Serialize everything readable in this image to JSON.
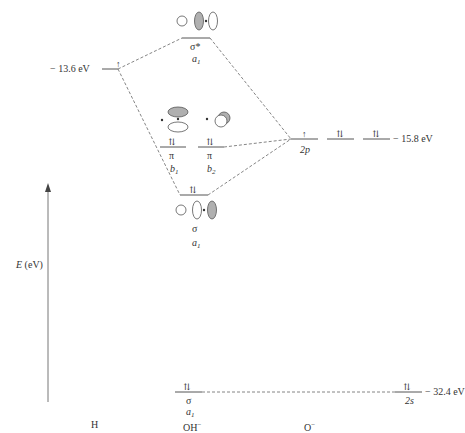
{
  "diagram": {
    "type": "molecular-orbital-energy-diagram",
    "axis": {
      "label_var": "E",
      "label_unit": "(eV)"
    },
    "columns": {
      "left": "H",
      "center": "OH",
      "center_charge": "−",
      "right": "O",
      "right_charge": "−"
    },
    "h_orbital": {
      "energy": "− 13.6 eV",
      "electrons": "↑"
    },
    "o_2p": {
      "label": "2p",
      "energy": "− 15.8 eV",
      "electrons": [
        "↑",
        "⇅",
        "⇅"
      ]
    },
    "o_2s": {
      "label": "2s",
      "energy": "− 32.4 eV",
      "electrons": "⇅"
    },
    "mo_sigma_star": {
      "label": "σ*",
      "symmetry": "a",
      "symmetry_sub": "1"
    },
    "mo_pi_b1": {
      "label": "π",
      "symmetry": "b",
      "symmetry_sub": "1",
      "electrons": "⇅"
    },
    "mo_pi_b2": {
      "label": "π",
      "symmetry": "b",
      "symmetry_sub": "2",
      "electrons": "⇅"
    },
    "mo_sigma": {
      "label": "σ",
      "symmetry": "a",
      "symmetry_sub": "1",
      "electrons": "⇅"
    },
    "mo_sigma_low": {
      "label": "σ",
      "symmetry": "a",
      "symmetry_sub": "1",
      "electrons": "⇅"
    },
    "colors": {
      "line": "#555555",
      "shaded_lobe": "#b0b0b0",
      "text": "#333333"
    }
  }
}
